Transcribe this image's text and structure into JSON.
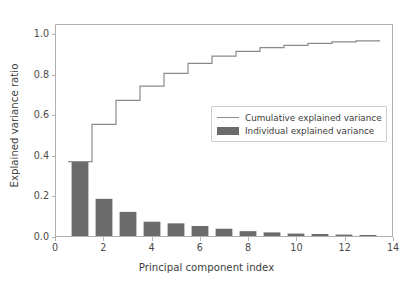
{
  "chart_data": {
    "type": "bar",
    "title": "",
    "subtitle": "",
    "xlabel": "Principal component index",
    "ylabel": "Explained variance ratio",
    "xlim": [
      0,
      14
    ],
    "ylim": [
      0.0,
      1.05
    ],
    "xticks": [
      "0",
      "2",
      "4",
      "6",
      "8",
      "10",
      "12",
      "14"
    ],
    "xtick_values": [
      0,
      2,
      4,
      6,
      8,
      10,
      12,
      14
    ],
    "yticks": [
      "0.0",
      "0.2",
      "0.4",
      "0.6",
      "0.8",
      "1.0"
    ],
    "ytick_values": [
      0.0,
      0.2,
      0.4,
      0.6,
      0.8,
      1.0
    ],
    "grid": false,
    "legend_position": "center-right",
    "categories": [
      1,
      2,
      3,
      4,
      5,
      6,
      7,
      8,
      9,
      10,
      11,
      12,
      13
    ],
    "series": [
      {
        "name": "Individual explained variance",
        "type": "bar",
        "color": "#6b6b6b",
        "values": [
          0.37,
          0.185,
          0.12,
          0.071,
          0.063,
          0.05,
          0.036,
          0.024,
          0.018,
          0.012,
          0.01,
          0.007,
          0.005
        ]
      },
      {
        "name": "Cumulative explained variance",
        "type": "step",
        "color": "#8a8a8a",
        "values": [
          0.37,
          0.555,
          0.675,
          0.746,
          0.809,
          0.859,
          0.895,
          0.919,
          0.937,
          0.949,
          0.959,
          0.966,
          0.971
        ]
      }
    ],
    "axis_color": "#b0b0b0",
    "text_color": "#3d3d3d",
    "background": "#ffffff"
  },
  "legend": {
    "items": [
      {
        "label": "Cumulative explained variance",
        "marker": "line"
      },
      {
        "label": "Individual explained variance",
        "marker": "box"
      }
    ]
  }
}
